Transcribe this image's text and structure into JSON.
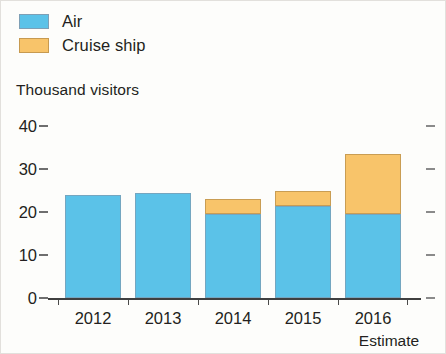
{
  "legend": {
    "items": [
      {
        "label": "Air",
        "color": "#5bc2e8",
        "swatch_name": "legend-swatch-air"
      },
      {
        "label": "Cruise ship",
        "color": "#f8c46a",
        "swatch_name": "legend-swatch-cruise-ship"
      }
    ]
  },
  "axis_title": "Thousand visitors",
  "estimate_note": "Estimate",
  "chart_data": {
    "type": "bar",
    "subtype": "stacked",
    "title": "",
    "subtitle": "",
    "xlabel": "",
    "ylabel": "Thousand visitors",
    "categories": [
      "2012",
      "2013",
      "2014",
      "2015",
      "2016"
    ],
    "series": [
      {
        "name": "Air",
        "color": "#5bc2e8",
        "values": [
          24,
          24.5,
          19.5,
          21.5,
          19.5
        ]
      },
      {
        "name": "Cruise ship",
        "color": "#f8c46a",
        "values": [
          0,
          0,
          3.5,
          3.5,
          14
        ]
      }
    ],
    "totals": [
      24,
      24.5,
      23,
      25,
      33.5
    ],
    "ylim": [
      0,
      40
    ],
    "yticks": [
      0,
      10,
      20,
      30,
      40
    ],
    "ytick_labels": [
      "0",
      "10",
      "20",
      "30",
      "40"
    ],
    "grid": false,
    "legend_position": "top-left",
    "annotations": [
      {
        "text": "Estimate",
        "category": "2016",
        "position": "below-axis-label"
      }
    ]
  }
}
